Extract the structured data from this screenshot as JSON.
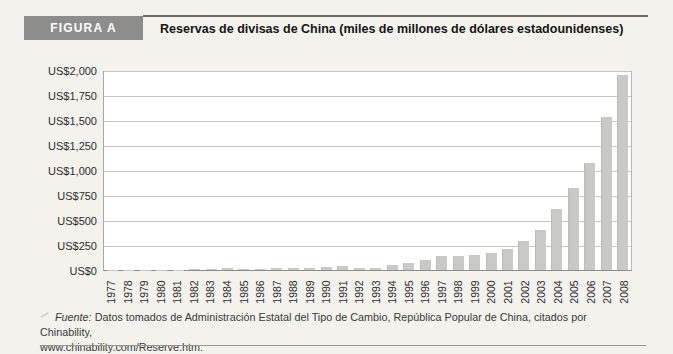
{
  "figure": {
    "label": "FIGURA A",
    "title": "Reservas de divisas de China (miles de millones de dólares estadounidenses)"
  },
  "source": {
    "prefix": "Fuente:",
    "line1": "Datos tomados de Administración Estatal del Tipo de Cambio, República Popular de China, citados por Chinability,",
    "line2": "www.chinability.com/Reserve.htm."
  },
  "colors": {
    "page_bg": "#f4f2ed",
    "plot_bg": "#ffffff",
    "bar": "#c9c9c5",
    "grid": "#c7c7c2",
    "axis": "#8e8e88",
    "header_box_bg": "#8d8d8b",
    "header_box_text": "#ffffff"
  },
  "chart_data": {
    "type": "bar",
    "title": "Reservas de divisas de China (miles de millones de dólares estadounidenses)",
    "xlabel": "",
    "ylabel": "",
    "unit": "miles de millones de US$",
    "categories": [
      "1977",
      "1978",
      "1979",
      "1980",
      "1981",
      "1982",
      "1983",
      "1984",
      "1985",
      "1986",
      "1987",
      "1988",
      "1989",
      "1990",
      "1991",
      "1992",
      "1993",
      "1994",
      "1995",
      "1996",
      "1997",
      "1998",
      "1999",
      "2000",
      "2001",
      "2002",
      "2003",
      "2004",
      "2005",
      "2006",
      "2007",
      "2008"
    ],
    "values": [
      2.3,
      1.6,
      2.2,
      2.5,
      5.1,
      11.3,
      14.3,
      17.4,
      12.7,
      11.5,
      16.3,
      18.5,
      17.0,
      29.6,
      43.7,
      19.4,
      21.2,
      51.6,
      73.6,
      105.0,
      139.9,
      145.0,
      154.7,
      165.6,
      212.2,
      286.4,
      403.3,
      609.9,
      818.9,
      1066.3,
      1528.2,
      1946.0
    ],
    "ylim": [
      0,
      2000
    ],
    "yticks": [
      0,
      250,
      500,
      750,
      1000,
      1250,
      1500,
      1750,
      2000
    ],
    "ytick_labels": [
      "US$0",
      "US$250",
      "US$500",
      "US$750",
      "US$1,000",
      "US$1,250",
      "US$1,500",
      "US$1,750",
      "US$2,000"
    ],
    "grid": "horizontal",
    "legend": "none",
    "bar_color": "#c9c9c5"
  }
}
